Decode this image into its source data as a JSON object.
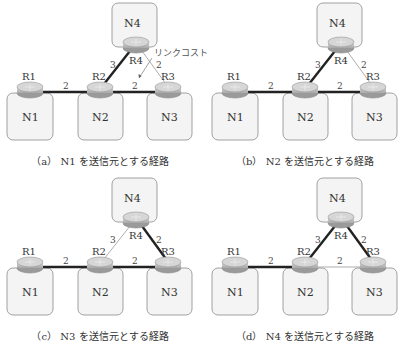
{
  "figure": {
    "nodes": {
      "networks": [
        "N1",
        "N2",
        "N3",
        "N4"
      ],
      "routers": [
        "R1",
        "R2",
        "R3",
        "R4"
      ]
    },
    "links": [
      {
        "from": "R1",
        "to": "R2",
        "cost": "2"
      },
      {
        "from": "R2",
        "to": "R3",
        "cost": "2"
      },
      {
        "from": "R2",
        "to": "R4",
        "cost": "3"
      },
      {
        "from": "R3",
        "to": "R4",
        "cost": "2"
      }
    ],
    "annotation": "リンクコスト",
    "colors": {
      "box_fill": "#f3f3f3",
      "box_stroke": "#888888",
      "router_fill": "#bfbfbf",
      "path_line": "#222222",
      "thin_line": "#999999"
    },
    "panels": [
      {
        "id": "a",
        "caption": "（a） N1 を送信元とする経路",
        "labels": {
          "n1": "N1",
          "n2": "N2",
          "n3": "N3",
          "n4": "N4",
          "r1": "R1",
          "r2": "R2",
          "r3": "R3",
          "r4": "R4"
        },
        "costs": {
          "r1r2": "2",
          "r2r3": "2",
          "r2r4": "3",
          "r3r4": "2"
        },
        "bold_links": [
          "R1-R2",
          "R2-R3",
          "R2-R4"
        ]
      },
      {
        "id": "b",
        "caption": "（b） N2 を送信元とする経路",
        "labels": {
          "n1": "N1",
          "n2": "N2",
          "n3": "N3",
          "n4": "N4",
          "r1": "R1",
          "r2": "R2",
          "r3": "R3",
          "r4": "R4"
        },
        "costs": {
          "r1r2": "2",
          "r2r3": "2",
          "r2r4": "3",
          "r3r4": "2"
        },
        "bold_links": [
          "R1-R2",
          "R2-R3",
          "R2-R4"
        ]
      },
      {
        "id": "c",
        "caption": "（c） N3 を送信元とする経路",
        "labels": {
          "n1": "N1",
          "n2": "N2",
          "n3": "N3",
          "n4": "N4",
          "r1": "R1",
          "r2": "R2",
          "r3": "R3",
          "r4": "R4"
        },
        "costs": {
          "r1r2": "2",
          "r2r3": "2",
          "r2r4": "3",
          "r3r4": "2"
        },
        "bold_links": [
          "R1-R2",
          "R2-R3",
          "R3-R4"
        ]
      },
      {
        "id": "d",
        "caption": "（d） N4 を送信元とする経路",
        "labels": {
          "n1": "N1",
          "n2": "N2",
          "n3": "N3",
          "n4": "N4",
          "r1": "R1",
          "r2": "R2",
          "r3": "R3",
          "r4": "R4"
        },
        "costs": {
          "r1r2": "2",
          "r2r3": "2",
          "r2r4": "3",
          "r3r4": "2"
        },
        "bold_links": [
          "R1-R2",
          "R2-R4",
          "R3-R4"
        ]
      }
    ]
  }
}
